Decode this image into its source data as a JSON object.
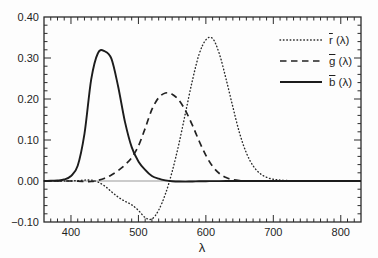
{
  "figure": {
    "background": "#fdfdfd",
    "axis_color": "#2b2b2b",
    "text_color": "#1f1f1f",
    "zero_line_color": "#999999"
  },
  "chart_data": {
    "type": "line",
    "title": "",
    "xlabel": "λ",
    "ylabel": "",
    "xlim": [
      360,
      830
    ],
    "ylim": [
      -0.1,
      0.4
    ],
    "x_tick_values": [
      400,
      500,
      600,
      700,
      800
    ],
    "x_tick_labels": [
      "400",
      "500",
      "600",
      "700",
      "800"
    ],
    "x_minor_step": 10,
    "y_tick_values": [
      -0.1,
      0.0,
      0.1,
      0.2,
      0.3,
      0.4
    ],
    "y_tick_labels": [
      "−0.10",
      "0.00",
      "0.10",
      "0.20",
      "0.30",
      "0.40"
    ],
    "y_minor_step": 0.02,
    "grid": false,
    "zero_line": true,
    "legend_position": "top-right",
    "x": [
      360,
      370,
      380,
      390,
      400,
      410,
      420,
      430,
      440,
      450,
      460,
      470,
      480,
      490,
      500,
      510,
      520,
      530,
      540,
      550,
      560,
      570,
      580,
      590,
      600,
      610,
      620,
      630,
      640,
      650,
      660,
      670,
      680,
      690,
      700,
      710,
      720,
      730,
      740,
      750,
      800,
      830
    ],
    "series": [
      {
        "id": "rbar",
        "name": "r̄ (λ)",
        "legend_letter": "r",
        "legend_suffix": " (λ)",
        "line_style": "dotted",
        "color": "#2a2a2a",
        "y": [
          0,
          0,
          0,
          0.0001,
          0.0003,
          0.0008,
          0.0021,
          0.0022,
          -0.0026,
          -0.0121,
          -0.0261,
          -0.0393,
          -0.0494,
          -0.0581,
          -0.0717,
          -0.089,
          -0.0926,
          -0.071,
          -0.0315,
          0.0228,
          0.0906,
          0.1677,
          0.2453,
          0.3093,
          0.3443,
          0.3476,
          0.31,
          0.2484,
          0.1805,
          0.1169,
          0.0687,
          0.0371,
          0.0188,
          0.0091,
          0.0041,
          0.0021,
          0.0011,
          0.0005,
          0.0003,
          0.0001,
          0,
          0
        ]
      },
      {
        "id": "gbar",
        "name": "ḡ (λ)",
        "legend_letter": "g",
        "legend_suffix": " (λ)",
        "line_style": "dashed",
        "color": "#222222",
        "y": [
          0,
          0,
          0,
          0,
          -0.0001,
          -0.0004,
          -0.0011,
          -0.0012,
          0.0015,
          0.0068,
          0.0149,
          0.0254,
          0.0391,
          0.0569,
          0.0854,
          0.1286,
          0.1747,
          0.2032,
          0.2147,
          0.2118,
          0.197,
          0.1709,
          0.1361,
          0.0975,
          0.0625,
          0.0356,
          0.0183,
          0.0083,
          0.0033,
          0.0012,
          0.0004,
          0.0001,
          0,
          0,
          0,
          0,
          0,
          0,
          0,
          0,
          0,
          0
        ]
      },
      {
        "id": "bbar",
        "name": "b̄ (λ)",
        "legend_letter": "b",
        "legend_suffix": " (λ)",
        "line_style": "solid",
        "color": "#1c1c1c",
        "y": [
          0.0001,
          0.0004,
          0.0012,
          0.0036,
          0.0121,
          0.0371,
          0.1154,
          0.2477,
          0.3123,
          0.3167,
          0.2982,
          0.2299,
          0.1449,
          0.0826,
          0.0478,
          0.027,
          0.0122,
          0.0055,
          0.0015,
          -0.0006,
          -0.0013,
          -0.0014,
          -0.0011,
          -0.0008,
          -0.0005,
          -0.0003,
          -0.0002,
          -0.0001,
          0,
          0,
          0,
          0,
          0,
          0,
          0,
          0,
          0,
          0,
          0,
          0,
          0,
          0
        ]
      }
    ]
  }
}
